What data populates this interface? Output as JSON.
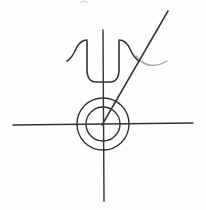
{
  "figure": {
    "medium": "pen-on-paper scan",
    "background_color": "#fefefe",
    "ink_color": "#333236",
    "secondary_ink_color": "#a9a6ac",
    "faint_ink_color": "#cfcdd2",
    "canvas": {
      "width": 206,
      "height": 210
    },
    "origin": {
      "x": 103,
      "y": 124
    }
  },
  "elements": {
    "horizontal_axis": {
      "label": "horizontal axis line",
      "x1": 13,
      "y1": 125,
      "x2": 193,
      "y2": 123,
      "stroke_width": 1.4
    },
    "vertical_axis": {
      "label": "vertical axis line",
      "x1": 103,
      "y1": 30,
      "x2": 104,
      "y2": 201,
      "stroke_width": 1.4
    },
    "diagonal_ray": {
      "label": "diagonal ray from origin to upper right",
      "x1": 102,
      "y1": 125,
      "x2": 168,
      "y2": 11,
      "stroke_width": 1.5
    },
    "outer_circle": {
      "label": "outer circle",
      "cx": 103,
      "cy": 124,
      "r": 26,
      "stroke_width": 1.4
    },
    "inner_circle": {
      "label": "inner circle",
      "cx": 103,
      "cy": 124,
      "r": 17,
      "stroke_width": 1.4
    },
    "psi_bowl": {
      "label": "U-shaped bowl of the psi glyph",
      "path": "M 87 41 L 87 69 Q 87 82 96 82 L 110 82 Q 119 82 119 69 L 119 41",
      "stroke_width": 1.6
    },
    "psi_left_horn": {
      "label": "left flaring horn of the psi glyph",
      "path": "M 87 40 Q 80 40 76 49 Q 72 58 67 61",
      "stroke_width": 1.6
    },
    "psi_right_horn": {
      "label": "right flaring horn of the psi glyph",
      "path": "M 119 40 Q 126 40 130 49 Q 134 58 139 61",
      "stroke_width": 1.6
    },
    "gray_arc": {
      "label": "light gray arc curving to the right",
      "path": "M 136 56 Q 148 72 167 61",
      "stroke_width": 1.4
    },
    "faint_top_mark": {
      "label": "faint partial mark clipped at top edge",
      "path": "M 80 3 Q 84 -1 88 3",
      "stroke_width": 1.3
    }
  }
}
